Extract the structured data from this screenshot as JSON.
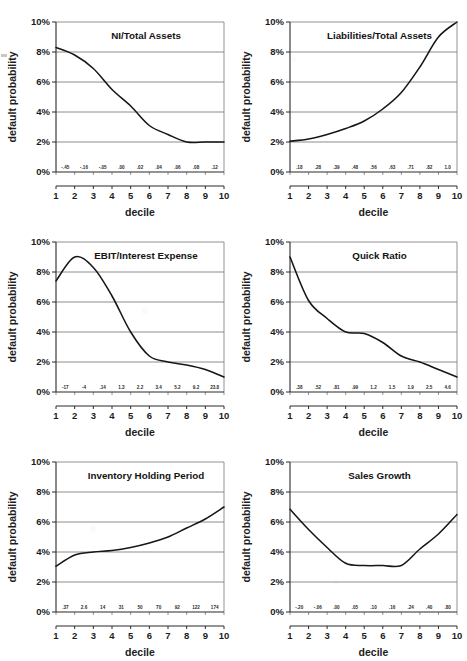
{
  "figure": {
    "background": "#ffffff",
    "ink_color": "#161616",
    "grid_color": "#6f6f6f",
    "layout": "2 columns x 3 rows",
    "shared_ylabel": "default probability",
    "shared_xlabel": "decile",
    "y_ticks": [
      "0%",
      "2%",
      "4%",
      "6%",
      "8%",
      "10%"
    ],
    "x_ticks": [
      "1",
      "2",
      "3",
      "4",
      "5",
      "6",
      "7",
      "8",
      "9",
      "10"
    ]
  },
  "chart_data": [
    {
      "type": "line",
      "title": "NI/Total Assets",
      "xlabel": "decile",
      "ylabel": "default probability",
      "ylim": [
        0,
        10
      ],
      "xlim": [
        1,
        10
      ],
      "grid": true,
      "legend": "none",
      "categories": [
        1,
        2,
        3,
        4,
        5,
        6,
        7,
        8,
        9,
        10
      ],
      "values": [
        8.3,
        7.8,
        6.9,
        5.5,
        4.4,
        3.1,
        2.5,
        2.0,
        2.0,
        2.0
      ],
      "bin_labels": [
        "-.45",
        "-.16",
        "-.05",
        ".00",
        ".02",
        ".04",
        ".06",
        ".08",
        ".12"
      ]
    },
    {
      "type": "line",
      "title": "Liabilities/Total Assets",
      "xlabel": "decile",
      "ylabel": "default probability",
      "ylim": [
        0,
        10
      ],
      "xlim": [
        1,
        10
      ],
      "grid": true,
      "legend": "none",
      "categories": [
        1,
        2,
        3,
        4,
        5,
        6,
        7,
        8,
        9,
        10
      ],
      "values": [
        2.05,
        2.2,
        2.5,
        2.9,
        3.4,
        4.2,
        5.3,
        7.0,
        9.0,
        10.0
      ],
      "bin_labels": [
        ".18",
        ".28",
        ".39",
        ".48",
        ".56",
        ".63",
        ".71",
        ".82",
        "1.0"
      ]
    },
    {
      "type": "line",
      "title": "EBIT/Interest Expense",
      "xlabel": "decile",
      "ylabel": "default probability",
      "ylim": [
        0,
        10
      ],
      "xlim": [
        1,
        10
      ],
      "grid": true,
      "legend": "none",
      "categories": [
        1,
        2,
        3,
        4,
        5,
        6,
        7,
        8,
        9,
        10
      ],
      "values": [
        7.4,
        9.0,
        8.3,
        6.4,
        4.0,
        2.4,
        2.0,
        1.8,
        1.5,
        1.0
      ],
      "bin_labels": [
        "-17",
        "-4",
        ".14",
        "1.3",
        "2.2",
        "3.4",
        "5.2",
        "9.2",
        "23.8"
      ]
    },
    {
      "type": "line",
      "title": "Quick Ratio",
      "xlabel": "decile",
      "ylabel": "default probability",
      "ylim": [
        0,
        10
      ],
      "xlim": [
        1,
        10
      ],
      "grid": true,
      "legend": "none",
      "categories": [
        1,
        2,
        3,
        4,
        5,
        6,
        7,
        8,
        9,
        10
      ],
      "values": [
        9.0,
        6.1,
        4.9,
        4.0,
        3.9,
        3.3,
        2.4,
        2.0,
        1.5,
        1.0
      ],
      "bin_labels": [
        ".38",
        ".52",
        ".81",
        ".99",
        "1.2",
        "1.5",
        "1.9",
        "2.5",
        "4.6"
      ]
    },
    {
      "type": "line",
      "title": "Inventory Holding Period",
      "xlabel": "decile",
      "ylabel": "default probability",
      "ylim": [
        0,
        10
      ],
      "xlim": [
        1,
        10
      ],
      "grid": true,
      "legend": "none",
      "categories": [
        1,
        2,
        3,
        4,
        5,
        6,
        7,
        8,
        9,
        10
      ],
      "values": [
        3.05,
        3.8,
        4.0,
        4.1,
        4.3,
        4.6,
        5.0,
        5.6,
        6.2,
        7.0
      ],
      "bin_labels": [
        ".37",
        "2.6",
        "14",
        "31",
        "50",
        "70",
        "92",
        "122",
        "174"
      ]
    },
    {
      "type": "line",
      "title": "Sales Growth",
      "xlabel": "decile",
      "ylabel": "default probability",
      "ylim": [
        0,
        10
      ],
      "xlim": [
        1,
        10
      ],
      "grid": true,
      "legend": "none",
      "categories": [
        1,
        2,
        3,
        4,
        5,
        6,
        7,
        8,
        9,
        10
      ],
      "values": [
        6.85,
        5.5,
        4.3,
        3.25,
        3.1,
        3.1,
        3.1,
        4.2,
        5.2,
        6.5
      ],
      "bin_labels": [
        "-.20",
        "-.06",
        ".00",
        ".05",
        ".10",
        ".16",
        ".24",
        ".40",
        ".80"
      ]
    }
  ]
}
